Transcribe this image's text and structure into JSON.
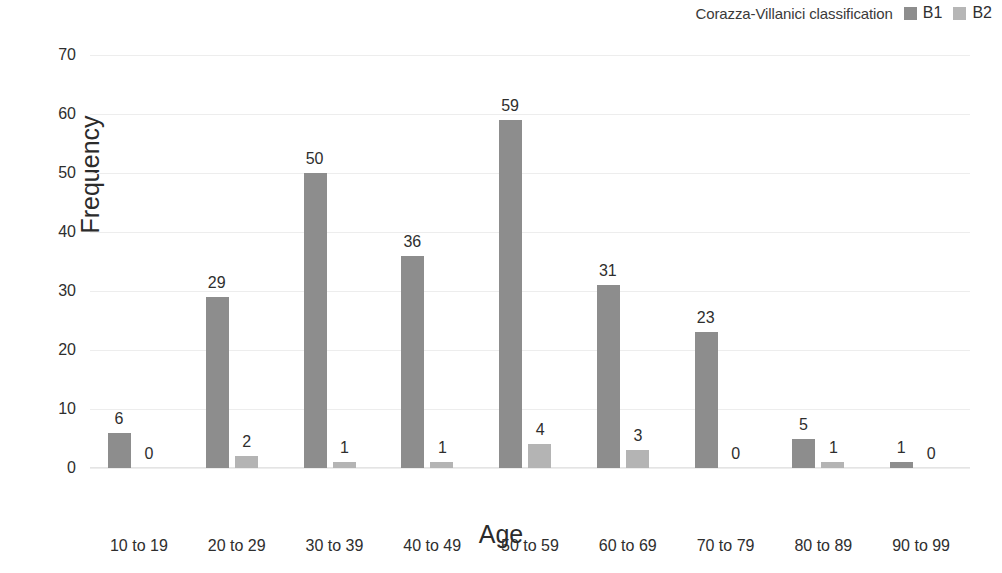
{
  "legend": {
    "title": "Corazza-Villanici classification",
    "entries": [
      {
        "label": "B1",
        "color": "#8d8d8d",
        "swatch_icon": "square-swatch-icon"
      },
      {
        "label": "B2",
        "color": "#b4b4b4",
        "swatch_icon": "square-swatch-icon"
      }
    ]
  },
  "axes": {
    "x_title": "Age",
    "y_title": "Frequency",
    "y_ticks": [
      "0",
      "10",
      "20",
      "30",
      "40",
      "50",
      "60",
      "70"
    ]
  },
  "chart_data": {
    "type": "bar",
    "title": "",
    "subtitle": "",
    "xlabel": "Age",
    "ylabel": "Frequency",
    "ylim": [
      0,
      70
    ],
    "ytick_step": 10,
    "grid": true,
    "legend_position": "top-right",
    "legend_title": "Corazza-Villanici classification",
    "categories": [
      "10 to 19",
      "20 to 29",
      "30 to 39",
      "40 to 49",
      "50 to 59",
      "60 to 69",
      "70 to 79",
      "80 to 89",
      "90 to 99"
    ],
    "series": [
      {
        "name": "B1",
        "color": "#8d8d8d",
        "values": [
          6,
          29,
          50,
          36,
          59,
          31,
          23,
          5,
          1
        ]
      },
      {
        "name": "B2",
        "color": "#b4b4b4",
        "values": [
          0,
          2,
          1,
          1,
          4,
          3,
          0,
          1,
          0
        ]
      }
    ],
    "data_labels": [
      {
        "category": "10 to 19",
        "B1": "6",
        "B2": "0"
      },
      {
        "category": "20 to 29",
        "B1": "29",
        "B2": "2"
      },
      {
        "category": "30 to 39",
        "B1": "50",
        "B2": "1"
      },
      {
        "category": "40 to 49",
        "B1": "36",
        "B2": "1"
      },
      {
        "category": "50 to 59",
        "B1": "59",
        "B2": "4"
      },
      {
        "category": "60 to 69",
        "B1": "31",
        "B2": "3"
      },
      {
        "category": "70 to 79",
        "B1": "23",
        "B2": "0"
      },
      {
        "category": "80 to 89",
        "B1": "5",
        "B2": "1"
      },
      {
        "category": "90 to 99",
        "B1": "1",
        "B2": "0"
      }
    ]
  }
}
